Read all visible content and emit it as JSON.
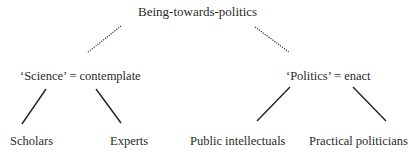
{
  "diagram": {
    "root": {
      "label": "Being-towards-politics"
    },
    "branches": [
      {
        "label": "‘Science’ = contemplate",
        "connector": "dotted",
        "children": [
          {
            "label": "Scholars"
          },
          {
            "label": "Experts"
          }
        ]
      },
      {
        "label": "‘Politics’ = enact",
        "connector": "dotted",
        "children": [
          {
            "label": "Public intellectuals"
          },
          {
            "label": "Practical politicians"
          }
        ]
      }
    ],
    "colors": {
      "text": "#2a2a2a",
      "line": "#222222",
      "background": "#ffffff"
    }
  }
}
